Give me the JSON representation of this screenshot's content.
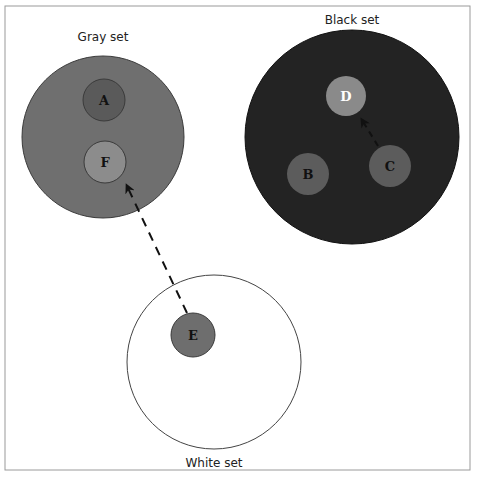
{
  "diagram": {
    "sets": [
      {
        "id": "gray",
        "label": "Gray set",
        "fill": "#6f6f6f"
      },
      {
        "id": "black",
        "label": "Black set",
        "fill": "#232323"
      },
      {
        "id": "white",
        "label": "White set",
        "fill": "#ffffff"
      }
    ],
    "nodes": [
      {
        "id": "A",
        "label": "A",
        "set": "gray",
        "fill": "#5a5a5a",
        "text_color": "#111111"
      },
      {
        "id": "F",
        "label": "F",
        "set": "gray",
        "fill": "#8c8c8c",
        "text_color": "#111111"
      },
      {
        "id": "D",
        "label": "D",
        "set": "black",
        "fill": "#8a8a8a",
        "text_color": "#ffffff"
      },
      {
        "id": "B",
        "label": "B",
        "set": "black",
        "fill": "#5c5c5c",
        "text_color": "#111111"
      },
      {
        "id": "C",
        "label": "C",
        "set": "black",
        "fill": "#5c5c5c",
        "text_color": "#111111"
      },
      {
        "id": "E",
        "label": "E",
        "set": "white",
        "fill": "#6e6e6e",
        "text_color": "#111111"
      }
    ],
    "edges": [
      {
        "from": "E",
        "to": "F",
        "style": "dashed-arrow"
      },
      {
        "from": "C",
        "to": "D",
        "style": "dashed-arrow"
      }
    ]
  }
}
